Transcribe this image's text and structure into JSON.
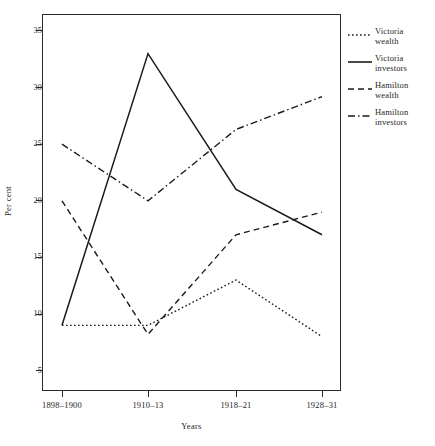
{
  "chart_data": {
    "type": "line",
    "title": "",
    "xlabel": "Years",
    "ylabel": "Per cent",
    "categories": [
      "1898–1900",
      "1910–13",
      "1918–21",
      "1928–31"
    ],
    "ylim": [
      3.2,
      36.5
    ],
    "yticks": [
      5,
      10,
      15,
      20,
      25,
      30,
      35
    ],
    "ytick_labels": [
      "5",
      "10",
      "15",
      "20",
      "25",
      "30",
      "35"
    ],
    "grid": false,
    "legend_position": "right",
    "series": [
      {
        "name": "Victoria\nwealth",
        "label_flat": "Victoria wealth",
        "linestyle": "dotted",
        "dasharray": "1.6 2.4",
        "color": "#1a1a1a",
        "values": [
          9,
          9,
          13,
          8
        ]
      },
      {
        "name": "Victoria\ninvestors",
        "label_flat": "Victoria investors",
        "linestyle": "solid",
        "dasharray": "none",
        "color": "#1a1a1a",
        "values": [
          9,
          33,
          21,
          17
        ]
      },
      {
        "name": "Hamilton\nwealth",
        "label_flat": "Hamilton wealth",
        "linestyle": "dashed",
        "dasharray": "6 4",
        "color": "#1a1a1a",
        "values": [
          20,
          8.2,
          17,
          19
        ]
      },
      {
        "name": "Hamilton\ninvestors",
        "label_flat": "Hamilton investors",
        "linestyle": "dashdot",
        "dasharray": "7 3 1.5 3",
        "color": "#1a1a1a",
        "values": [
          25,
          20,
          26.3,
          29.2
        ]
      }
    ]
  },
  "axes": {
    "y_title": "Per cent",
    "x_title": "Years"
  }
}
